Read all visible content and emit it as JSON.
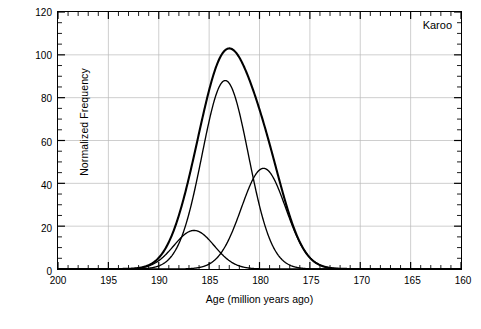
{
  "figure": {
    "annotation": "Karoo",
    "caption": ""
  },
  "chart_data": {
    "type": "line",
    "title": "",
    "xlabel": "Age (million years ago)",
    "ylabel": "Normalized Frequency",
    "annotation": "Karoo",
    "xlim": [
      200,
      160
    ],
    "ylim": [
      0,
      120
    ],
    "x_reversed": true,
    "grid": true,
    "legend": "none",
    "xticks": [
      200,
      195,
      190,
      185,
      180,
      175,
      170,
      165,
      160
    ],
    "xtick_labels": [
      "200",
      "195",
      "190",
      "185",
      "180",
      "175",
      "170",
      "165",
      "160"
    ],
    "x_minor_tick_interval": 1,
    "yticks": [
      0,
      20,
      40,
      60,
      80,
      100,
      120
    ],
    "ytick_labels": [
      "0",
      "20",
      "40",
      "60",
      "80",
      "100",
      "120"
    ],
    "y_minor_tick_interval": 5,
    "series": [
      {
        "name": "component-1",
        "role": "gaussian-component",
        "peak_x": 186.5,
        "peak_y": 18,
        "sigma": 2.0
      },
      {
        "name": "component-2",
        "role": "gaussian-component",
        "peak_x": 183.4,
        "peak_y": 88,
        "sigma": 2.3
      },
      {
        "name": "component-3",
        "role": "gaussian-component",
        "peak_x": 179.6,
        "peak_y": 47,
        "sigma": 2.2
      },
      {
        "name": "sum-curve",
        "role": "sum-of-components",
        "peak_x": 183.2,
        "peak_y": 103
      }
    ]
  }
}
